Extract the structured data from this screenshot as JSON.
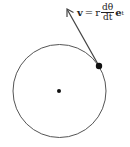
{
  "diagram": {
    "formula": {
      "lhs": "v",
      "equals": "=",
      "r": "r",
      "numerator": "dθ",
      "denominator": "dt",
      "unit_vector": "e",
      "unit_vector_subscript": "t"
    },
    "elements": {
      "circle": {
        "cx": 59.5,
        "cy": 91,
        "r": 46.5,
        "stroke": "#555555"
      },
      "center_point": {
        "cx": 59,
        "cy": 91,
        "r": 2
      },
      "moving_point": {
        "cx": 99,
        "cy": 66,
        "r": 3.2
      },
      "velocity_arrow": {
        "x1": 99,
        "y1": 66,
        "x2": 67,
        "y2": 9,
        "stroke": "#444444"
      }
    }
  }
}
